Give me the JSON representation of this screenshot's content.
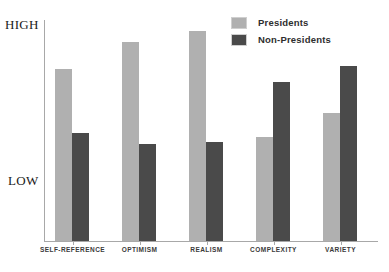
{
  "chart_data": {
    "type": "bar",
    "title": "",
    "xlabel": "",
    "ylabel": "",
    "categories": [
      "SELF-REFERENCE",
      "OPTIMISM",
      "REALISM",
      "COMPLEXITY",
      "VARIETY"
    ],
    "series": [
      {
        "name": "Presidents",
        "color": "#b0b0b0",
        "values": [
          78,
          90,
          95,
          47,
          58
        ]
      },
      {
        "name": "Non-Presidents",
        "color": "#4a4a4a",
        "values": [
          49,
          44,
          45,
          72,
          79
        ]
      }
    ],
    "ylim": [
      0,
      100
    ],
    "y_tick_labels": [
      "HIGH",
      "LOW"
    ],
    "y_axis_high_label": "HIGH",
    "y_axis_low_label": "LOW",
    "grid": false,
    "legend_position": "top-right"
  },
  "legend": {
    "items": [
      {
        "label": "Presidents",
        "swatch": "light-gray-swatch-icon"
      },
      {
        "label": "Non-Presidents",
        "swatch": "dark-gray-swatch-icon"
      }
    ]
  },
  "axes": {
    "y_high": "HIGH",
    "y_low": "LOW"
  }
}
